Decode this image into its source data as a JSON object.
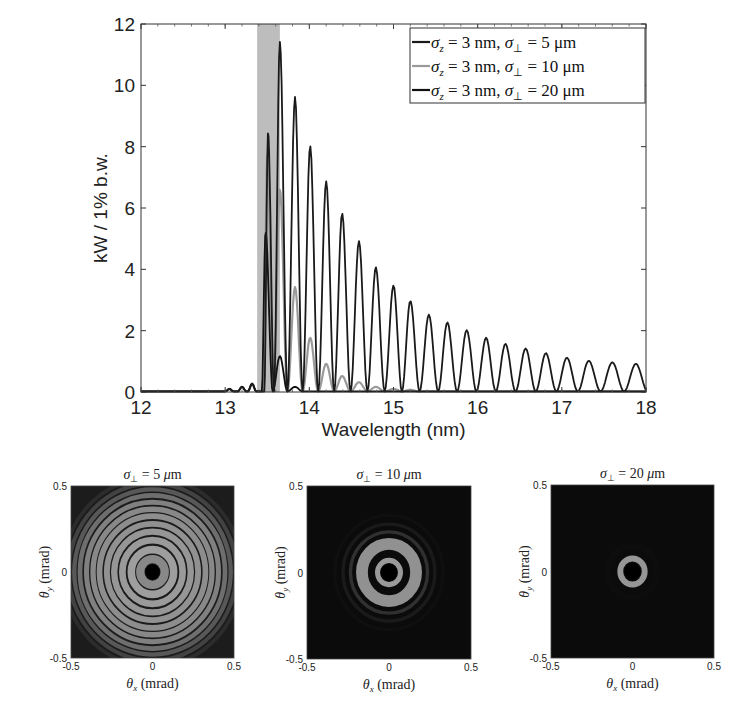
{
  "chart_data": [
    {
      "type": "line",
      "title": "",
      "xlabel": "Wavelength (nm)",
      "ylabel": "kW / 1% b.w.",
      "xlim": [
        12,
        18
      ],
      "ylim": [
        0,
        12
      ],
      "xticks": [
        12,
        13,
        14,
        15,
        16,
        17,
        18
      ],
      "yticks": [
        0,
        2,
        4,
        6,
        8,
        10,
        12
      ],
      "grid": false,
      "legend_position": "upper right",
      "shaded_band": {
        "x0": 13.38,
        "x1": 13.65,
        "color": "#bdbdbd"
      },
      "series": [
        {
          "name": "σ_z = 3 nm, σ_⊥ = 5 μm",
          "color": "#1a1a1a",
          "peaks": [
            [
              13.51,
              8.45
            ],
            [
              13.65,
              11.4
            ],
            [
              13.83,
              9.6
            ],
            [
              14.01,
              8.0
            ],
            [
              14.2,
              6.85
            ],
            [
              14.39,
              5.8
            ],
            [
              14.59,
              4.9
            ],
            [
              14.79,
              4.05
            ],
            [
              15.0,
              3.45
            ],
            [
              15.2,
              2.95
            ],
            [
              15.42,
              2.5
            ],
            [
              15.64,
              2.25
            ],
            [
              15.87,
              2.0
            ],
            [
              16.1,
              1.75
            ],
            [
              16.33,
              1.55
            ],
            [
              16.57,
              1.4
            ],
            [
              16.81,
              1.25
            ],
            [
              17.06,
              1.1
            ],
            [
              17.32,
              1.0
            ],
            [
              17.6,
              0.95
            ],
            [
              17.88,
              0.9
            ]
          ],
          "tail_end_value": 0.7
        },
        {
          "name": "σ_z = 3 nm, σ_⊥ = 10 μm",
          "color": "#9a9a9a",
          "peaks": [
            [
              13.5,
              7.7
            ],
            [
              13.65,
              6.6
            ],
            [
              13.83,
              3.4
            ],
            [
              14.01,
              1.75
            ],
            [
              14.2,
              0.9
            ],
            [
              14.39,
              0.5
            ],
            [
              14.59,
              0.3
            ],
            [
              14.79,
              0.15
            ],
            [
              15.0,
              0.08
            ],
            [
              15.2,
              0.05
            ]
          ]
        },
        {
          "name": "σ_z = 3 nm, σ_⊥ = 20 μm",
          "color": "#111111",
          "peaks": [
            [
              13.48,
              5.2
            ],
            [
              13.65,
              1.15
            ],
            [
              13.83,
              0.15
            ]
          ]
        }
      ],
      "pre_band_bumps": [
        [
          13.05,
          0.08
        ],
        [
          13.2,
          0.15
        ],
        [
          13.32,
          0.25
        ]
      ]
    },
    {
      "type": "heatmap",
      "panels": [
        {
          "title": "σ⊥ = 5 μm",
          "xlabel": "θx (mrad)",
          "ylabel": "θy (mrad)",
          "xlim": [
            -0.5,
            0.5
          ],
          "ylim": [
            -0.5,
            0.5
          ],
          "xticks": [
            "-0.5",
            "0",
            "0.5"
          ],
          "yticks": [
            "-0.5",
            "0",
            "0.5"
          ],
          "description": "many concentric bright/dark rings filling panel, dark center",
          "rings": [
            {
              "r": 0.075,
              "w": 0.05,
              "v": 0.62
            },
            {
              "r": 0.13,
              "w": 0.045,
              "v": 0.72
            },
            {
              "r": 0.185,
              "w": 0.04,
              "v": 0.7
            },
            {
              "r": 0.235,
              "w": 0.038,
              "v": 0.68
            },
            {
              "r": 0.28,
              "w": 0.035,
              "v": 0.66
            },
            {
              "r": 0.325,
              "w": 0.034,
              "v": 0.64
            },
            {
              "r": 0.365,
              "w": 0.032,
              "v": 0.62
            },
            {
              "r": 0.405,
              "w": 0.03,
              "v": 0.58
            },
            {
              "r": 0.445,
              "w": 0.028,
              "v": 0.5
            },
            {
              "r": 0.48,
              "w": 0.026,
              "v": 0.4
            },
            {
              "r": 0.515,
              "w": 0.024,
              "v": 0.3
            },
            {
              "r": 0.55,
              "w": 0.022,
              "v": 0.2
            }
          ]
        },
        {
          "title": "σ⊥ = 10 μm",
          "xlabel": "θx (mrad)",
          "ylabel": "θy (mrad)",
          "xlim": [
            -0.5,
            0.5
          ],
          "ylim": [
            -0.5,
            0.5
          ],
          "xticks": [
            "-0.5",
            "0",
            "0.5"
          ],
          "yticks": [
            "-0.5",
            "0",
            "0.5"
          ],
          "description": "dark center, thin bright ring, broad bright ring, faint outer rings",
          "rings": [
            {
              "r": 0.07,
              "w": 0.03,
              "v": 0.7
            },
            {
              "r": 0.165,
              "w": 0.07,
              "v": 0.66
            },
            {
              "r": 0.235,
              "w": 0.02,
              "v": 0.22
            },
            {
              "r": 0.28,
              "w": 0.02,
              "v": 0.12
            },
            {
              "r": 0.33,
              "w": 0.02,
              "v": 0.07
            }
          ]
        },
        {
          "title": "σ⊥ = 20 μm",
          "xlabel": "θx (mrad)",
          "ylabel": "θy (mrad)",
          "xlim": [
            -0.5,
            0.5
          ],
          "ylim": [
            -0.5,
            0.5
          ],
          "xticks": [
            "-0.5",
            "0",
            "0.5"
          ],
          "yticks": [
            "-0.5",
            "0",
            "0.5"
          ],
          "description": "single small bright ring near center, dark elsewhere",
          "rings": [
            {
              "r": 0.075,
              "w": 0.035,
              "v": 0.68
            },
            {
              "r": 0.15,
              "w": 0.04,
              "v": 0.06
            }
          ]
        }
      ]
    }
  ],
  "legend": {
    "entries": [
      {
        "prefix": "σ",
        "sub": "z",
        "mid": " = 3 nm, σ",
        "sub2": "⊥",
        "suffix": " = 5 μm",
        "color": "#1a1a1a"
      },
      {
        "prefix": "σ",
        "sub": "z",
        "mid": " = 3 nm, σ",
        "sub2": "⊥",
        "suffix": " = 10 μm",
        "color": "#9a9a9a"
      },
      {
        "prefix": "σ",
        "sub": "z",
        "mid": " = 3 nm, σ",
        "sub2": "⊥",
        "suffix": " = 20 μm",
        "color": "#111111"
      }
    ]
  },
  "panel_titles": [
    "σ⊥ = 5 μm",
    "σ⊥ = 10 μm",
    "σ⊥ = 20 μm"
  ]
}
